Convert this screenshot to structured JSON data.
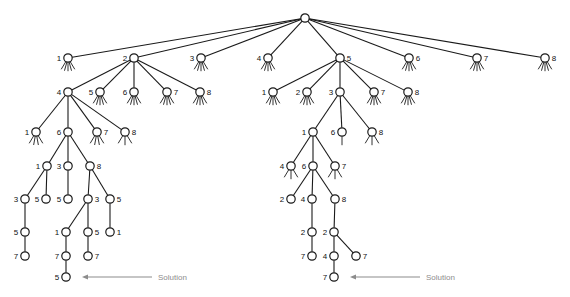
{
  "figure": {
    "background_color": "#ffffff",
    "stroke_color": "#1a1a1a",
    "node_fill": "#ffffff",
    "solution_color": "#8c8c8c",
    "solution_label_left": "Solution",
    "solution_label_right": "Solution"
  },
  "tree": {
    "node_radius": 4.2,
    "leaf_stub_count": 5,
    "leaf_stub_length": 9,
    "nodes": [
      {
        "id": "root",
        "label": "",
        "x": 305,
        "y": 18,
        "expanded": true,
        "label_side": "none",
        "stubs": 0
      },
      {
        "id": "a1",
        "label": "1",
        "x": 68,
        "y": 58,
        "expanded": false,
        "label_side": "left",
        "stubs": 5
      },
      {
        "id": "a2",
        "label": "2",
        "x": 134,
        "y": 58,
        "expanded": true,
        "label_side": "left",
        "stubs": 0
      },
      {
        "id": "a3",
        "label": "3",
        "x": 201,
        "y": 58,
        "expanded": false,
        "label_side": "left",
        "stubs": 5
      },
      {
        "id": "a4",
        "label": "4",
        "x": 268,
        "y": 58,
        "expanded": false,
        "label_side": "left",
        "stubs": 5
      },
      {
        "id": "a5",
        "label": "5",
        "x": 340,
        "y": 58,
        "expanded": true,
        "label_side": "right",
        "stubs": 0
      },
      {
        "id": "a6",
        "label": "6",
        "x": 409,
        "y": 58,
        "expanded": false,
        "label_side": "right",
        "stubs": 5
      },
      {
        "id": "a7",
        "label": "7",
        "x": 477,
        "y": 58,
        "expanded": false,
        "label_side": "right",
        "stubs": 5
      },
      {
        "id": "a8",
        "label": "8",
        "x": 545,
        "y": 58,
        "expanded": false,
        "label_side": "right",
        "stubs": 5
      },
      {
        "id": "b4",
        "label": "4",
        "x": 68,
        "y": 92,
        "expanded": true,
        "label_side": "left",
        "stubs": 0
      },
      {
        "id": "b5",
        "label": "5",
        "x": 100,
        "y": 92,
        "expanded": false,
        "label_side": "left",
        "stubs": 5
      },
      {
        "id": "b6",
        "label": "6",
        "x": 134,
        "y": 92,
        "expanded": false,
        "label_side": "left",
        "stubs": 5
      },
      {
        "id": "b7",
        "label": "7",
        "x": 167,
        "y": 92,
        "expanded": false,
        "label_side": "right",
        "stubs": 5
      },
      {
        "id": "b8",
        "label": "8",
        "x": 200,
        "y": 92,
        "expanded": false,
        "label_side": "right",
        "stubs": 5
      },
      {
        "id": "c1",
        "label": "1",
        "x": 273,
        "y": 92,
        "expanded": false,
        "label_side": "left",
        "stubs": 5
      },
      {
        "id": "c2",
        "label": "2",
        "x": 307,
        "y": 92,
        "expanded": false,
        "label_side": "left",
        "stubs": 5
      },
      {
        "id": "c3",
        "label": "3",
        "x": 340,
        "y": 92,
        "expanded": true,
        "label_side": "left",
        "stubs": 0
      },
      {
        "id": "c7",
        "label": "7",
        "x": 374,
        "y": 92,
        "expanded": false,
        "label_side": "right",
        "stubs": 5
      },
      {
        "id": "c8",
        "label": "8",
        "x": 408,
        "y": 92,
        "expanded": false,
        "label_side": "right",
        "stubs": 5
      },
      {
        "id": "d1",
        "label": "1",
        "x": 36,
        "y": 132,
        "expanded": false,
        "label_side": "left",
        "stubs": 4
      },
      {
        "id": "d6",
        "label": "6",
        "x": 68,
        "y": 132,
        "expanded": true,
        "label_side": "left",
        "stubs": 0
      },
      {
        "id": "d7",
        "label": "7",
        "x": 97,
        "y": 132,
        "expanded": false,
        "label_side": "right",
        "stubs": 4
      },
      {
        "id": "d8",
        "label": "8",
        "x": 125,
        "y": 132,
        "expanded": false,
        "label_side": "right",
        "stubs": 3
      },
      {
        "id": "e1",
        "label": "1",
        "x": 313,
        "y": 132,
        "expanded": true,
        "label_side": "left",
        "stubs": 0
      },
      {
        "id": "e6",
        "label": "6",
        "x": 342,
        "y": 132,
        "expanded": false,
        "label_side": "left",
        "stubs": 1
      },
      {
        "id": "e8",
        "label": "8",
        "x": 372,
        "y": 132,
        "expanded": false,
        "label_side": "right",
        "stubs": 3
      },
      {
        "id": "f1",
        "label": "1",
        "x": 47,
        "y": 166,
        "expanded": true,
        "label_side": "left",
        "stubs": 0
      },
      {
        "id": "f3",
        "label": "3",
        "x": 68,
        "y": 166,
        "expanded": true,
        "label_side": "left",
        "stubs": 0
      },
      {
        "id": "f8",
        "label": "8",
        "x": 90,
        "y": 166,
        "expanded": true,
        "label_side": "right",
        "stubs": 0
      },
      {
        "id": "g4",
        "label": "4",
        "x": 291,
        "y": 166,
        "expanded": false,
        "label_side": "left",
        "stubs": 3
      },
      {
        "id": "g6",
        "label": "6",
        "x": 313,
        "y": 166,
        "expanded": true,
        "label_side": "left",
        "stubs": 0
      },
      {
        "id": "g7",
        "label": "7",
        "x": 335,
        "y": 166,
        "expanded": false,
        "label_side": "right",
        "stubs": 3
      },
      {
        "id": "h3",
        "label": "3",
        "x": 25,
        "y": 199,
        "expanded": true,
        "label_side": "left",
        "stubs": 0
      },
      {
        "id": "h5a",
        "label": "5",
        "x": 46,
        "y": 199,
        "expanded": false,
        "label_side": "left",
        "stubs": 0
      },
      {
        "id": "h5b",
        "label": "5",
        "x": 68,
        "y": 199,
        "expanded": false,
        "label_side": "left",
        "stubs": 0
      },
      {
        "id": "h3b",
        "label": "3",
        "x": 88,
        "y": 199,
        "expanded": true,
        "label_side": "right",
        "stubs": 0
      },
      {
        "id": "h5c",
        "label": "5",
        "x": 110,
        "y": 199,
        "expanded": true,
        "label_side": "right",
        "stubs": 0
      },
      {
        "id": "i2",
        "label": "2",
        "x": 291,
        "y": 199,
        "expanded": false,
        "label_side": "left",
        "stubs": 0
      },
      {
        "id": "i4",
        "label": "4",
        "x": 312,
        "y": 199,
        "expanded": true,
        "label_side": "left",
        "stubs": 0
      },
      {
        "id": "i8",
        "label": "8",
        "x": 335,
        "y": 199,
        "expanded": true,
        "label_side": "right",
        "stubs": 0
      },
      {
        "id": "j5",
        "label": "5",
        "x": 25,
        "y": 232,
        "expanded": true,
        "label_side": "left",
        "stubs": 0
      },
      {
        "id": "j1",
        "label": "1",
        "x": 66,
        "y": 232,
        "expanded": true,
        "label_side": "left",
        "stubs": 0
      },
      {
        "id": "j5b",
        "label": "5",
        "x": 88,
        "y": 232,
        "expanded": true,
        "label_side": "right",
        "stubs": 0
      },
      {
        "id": "j1b",
        "label": "1",
        "x": 110,
        "y": 232,
        "expanded": false,
        "label_side": "right",
        "stubs": 0
      },
      {
        "id": "k2a",
        "label": "2",
        "x": 312,
        "y": 232,
        "expanded": true,
        "label_side": "left",
        "stubs": 0
      },
      {
        "id": "k2b",
        "label": "2",
        "x": 334,
        "y": 232,
        "expanded": true,
        "label_side": "left",
        "stubs": 0
      },
      {
        "id": "l7",
        "label": "7",
        "x": 25,
        "y": 256,
        "expanded": false,
        "label_side": "left",
        "stubs": 0
      },
      {
        "id": "l7b",
        "label": "7",
        "x": 66,
        "y": 256,
        "expanded": true,
        "label_side": "left",
        "stubs": 0
      },
      {
        "id": "l7c",
        "label": "7",
        "x": 88,
        "y": 256,
        "expanded": false,
        "label_side": "right",
        "stubs": 0
      },
      {
        "id": "m7",
        "label": "7",
        "x": 312,
        "y": 256,
        "expanded": false,
        "label_side": "left",
        "stubs": 0
      },
      {
        "id": "m4",
        "label": "4",
        "x": 334,
        "y": 256,
        "expanded": true,
        "label_side": "left",
        "stubs": 0
      },
      {
        "id": "m7b",
        "label": "7",
        "x": 356,
        "y": 256,
        "expanded": false,
        "label_side": "right",
        "stubs": 0
      },
      {
        "id": "n5",
        "label": "5",
        "x": 66,
        "y": 277,
        "expanded": false,
        "label_side": "left",
        "stubs": 0,
        "solution": true
      },
      {
        "id": "n7",
        "label": "7",
        "x": 334,
        "y": 277,
        "expanded": false,
        "label_side": "left",
        "stubs": 0,
        "solution": true
      }
    ],
    "edges": [
      [
        "root",
        "a1"
      ],
      [
        "root",
        "a2"
      ],
      [
        "root",
        "a3"
      ],
      [
        "root",
        "a4"
      ],
      [
        "root",
        "a5"
      ],
      [
        "root",
        "a6"
      ],
      [
        "root",
        "a7"
      ],
      [
        "root",
        "a8"
      ],
      [
        "a2",
        "b4"
      ],
      [
        "a2",
        "b5"
      ],
      [
        "a2",
        "b6"
      ],
      [
        "a2",
        "b7"
      ],
      [
        "a2",
        "b8"
      ],
      [
        "a5",
        "c1"
      ],
      [
        "a5",
        "c2"
      ],
      [
        "a5",
        "c3"
      ],
      [
        "a5",
        "c7"
      ],
      [
        "a5",
        "c8"
      ],
      [
        "b4",
        "d1"
      ],
      [
        "b4",
        "d6"
      ],
      [
        "b4",
        "d7"
      ],
      [
        "b4",
        "d8"
      ],
      [
        "c3",
        "e1"
      ],
      [
        "c3",
        "e6"
      ],
      [
        "c3",
        "e8"
      ],
      [
        "d6",
        "f1"
      ],
      [
        "d6",
        "f3"
      ],
      [
        "d6",
        "f8"
      ],
      [
        "e1",
        "g4"
      ],
      [
        "e1",
        "g6"
      ],
      [
        "e1",
        "g7"
      ],
      [
        "f1",
        "h3"
      ],
      [
        "f1",
        "h5a"
      ],
      [
        "f3",
        "h5b"
      ],
      [
        "f8",
        "h3b"
      ],
      [
        "f8",
        "h5c"
      ],
      [
        "g6",
        "i2"
      ],
      [
        "g6",
        "i4"
      ],
      [
        "g6",
        "i8"
      ],
      [
        "h3",
        "j5"
      ],
      [
        "h3b",
        "j1"
      ],
      [
        "h3b",
        "j5b"
      ],
      [
        "h5c",
        "j1b"
      ],
      [
        "i4",
        "k2a"
      ],
      [
        "i8",
        "k2b"
      ],
      [
        "j5",
        "l7"
      ],
      [
        "j1",
        "l7b"
      ],
      [
        "j5b",
        "l7c"
      ],
      [
        "k2a",
        "m7"
      ],
      [
        "k2b",
        "m4"
      ],
      [
        "k2b",
        "m7b"
      ],
      [
        "l7b",
        "n5"
      ],
      [
        "m4",
        "n7"
      ]
    ]
  },
  "annotations": {
    "solution_left": {
      "label": "Solution",
      "node_x": 66,
      "node_y": 277,
      "arrow_tail_x": 152,
      "arrow_head_x": 82,
      "y": 277,
      "text_x": 158
    },
    "solution_right": {
      "label": "Solution",
      "node_x": 334,
      "node_y": 277,
      "arrow_tail_x": 420,
      "arrow_head_x": 350,
      "y": 277,
      "text_x": 426
    }
  }
}
